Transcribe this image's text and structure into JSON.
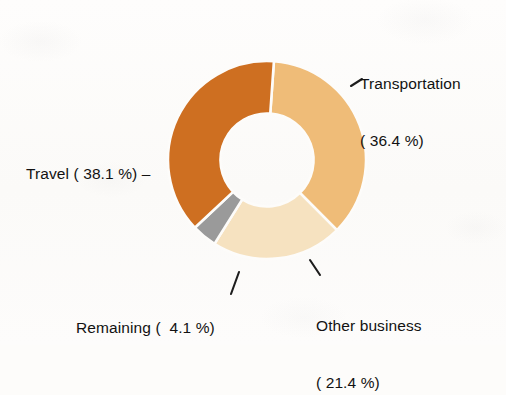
{
  "chart_data": {
    "type": "pie",
    "variant": "donut",
    "title": "",
    "subtitle": "",
    "xlabel": "",
    "ylabel": "",
    "legend_position": "none",
    "grid": false,
    "units": "%",
    "start_angle_deg": 4,
    "direction": "clockwise",
    "inner_radius_ratio": 0.47,
    "categories": [
      "Transportation",
      "Other business",
      "Remaining",
      "Travel"
    ],
    "values": [
      36.4,
      21.4,
      4.1,
      38.1
    ],
    "colors": [
      "#efbc78",
      "#f6e2c0",
      "#9a9a9a",
      "#ce6f21"
    ],
    "slices": [
      {
        "name": "Transportation",
        "value": 36.4,
        "color": "#efbc78",
        "label_line1": "Transportation",
        "label_line2": "( 36.4 %)"
      },
      {
        "name": "Other business",
        "value": 21.4,
        "color": "#f6e2c0",
        "label_line1": "Other business",
        "label_line2": "( 21.4 %)"
      },
      {
        "name": "Remaining",
        "value": 4.1,
        "color": "#9a9a9a",
        "label_line1": "Remaining (  4.1 %)",
        "label_line2": ""
      },
      {
        "name": "Travel",
        "value": 38.1,
        "color": "#ce6f21",
        "label_line1": "Travel ( 38.1 %) –",
        "label_line2": ""
      }
    ]
  },
  "labels": {
    "transportation_line1": "Transportation",
    "transportation_line2": "( 36.4 %)",
    "travel": "Travel ( 38.1 %) –",
    "remaining": "Remaining (  4.1 %)",
    "other_business_line1": "Other business",
    "other_business_line2": "( 21.4 %)"
  },
  "colors": {
    "background": "#fdfcfa",
    "text": "#121212",
    "leader_line": "#1d1d1d",
    "transportation": "#efbc78",
    "other_business": "#f6e2c0",
    "remaining": "#9a9a9a",
    "travel": "#ce6f21"
  }
}
